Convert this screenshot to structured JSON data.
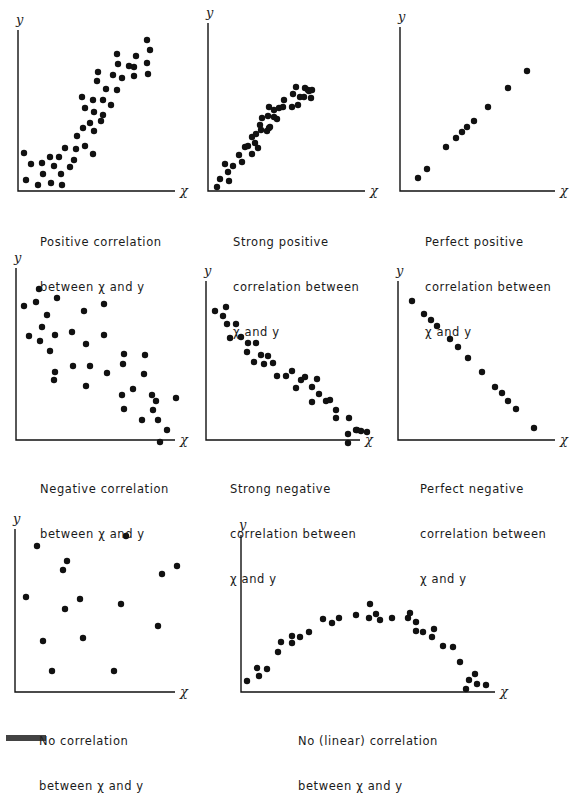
{
  "figure": {
    "title_fragment": "Figure"
  },
  "chart_data": [
    {
      "type": "scatter",
      "title": "Positive correlation between x and y",
      "caption_lines": [
        "Positive correlation",
        "between x and y"
      ],
      "xlabel": "x",
      "ylabel": "y",
      "grid": false,
      "points": [
        [
          24,
          153
        ],
        [
          31,
          164
        ],
        [
          42,
          163
        ],
        [
          50,
          157
        ],
        [
          59,
          157
        ],
        [
          54,
          166
        ],
        [
          43,
          174
        ],
        [
          26,
          180
        ],
        [
          38,
          185
        ],
        [
          51,
          183
        ],
        [
          62,
          185
        ],
        [
          61,
          174
        ],
        [
          70,
          167
        ],
        [
          65,
          148
        ],
        [
          74,
          160
        ],
        [
          76,
          149
        ],
        [
          77,
          136
        ],
        [
          85,
          146
        ],
        [
          83,
          128
        ],
        [
          93,
          154
        ],
        [
          94,
          131
        ],
        [
          90,
          123
        ],
        [
          101,
          121
        ],
        [
          94,
          112
        ],
        [
          85,
          108
        ],
        [
          82,
          97
        ],
        [
          93,
          100
        ],
        [
          103,
          115
        ],
        [
          103,
          100
        ],
        [
          111,
          105
        ],
        [
          106,
          89
        ],
        [
          97,
          81
        ],
        [
          98,
          72
        ],
        [
          113,
          75
        ],
        [
          117,
          90
        ],
        [
          122,
          78
        ],
        [
          118,
          64
        ],
        [
          117,
          54
        ],
        [
          129,
          66
        ],
        [
          134,
          76
        ],
        [
          136,
          56
        ],
        [
          134,
          67
        ],
        [
          147,
          63
        ],
        [
          148,
          74
        ],
        [
          150,
          50
        ],
        [
          147,
          40
        ]
      ]
    },
    {
      "type": "scatter",
      "title": "Strong positive correlation between x and y",
      "caption_lines": [
        "Strong positive",
        "correlation between",
        "x and y"
      ],
      "xlabel": "x",
      "ylabel": "y",
      "grid": false,
      "points": [
        [
          217,
          187
        ],
        [
          220,
          179
        ],
        [
          225,
          164
        ],
        [
          228,
          172
        ],
        [
          229,
          181
        ],
        [
          233,
          166
        ],
        [
          239,
          155
        ],
        [
          242,
          162
        ],
        [
          245,
          147
        ],
        [
          248,
          146
        ],
        [
          252,
          154
        ],
        [
          252,
          137
        ],
        [
          255,
          143
        ],
        [
          256,
          134
        ],
        [
          258,
          148
        ],
        [
          260,
          125
        ],
        [
          261,
          130
        ],
        [
          262,
          118
        ],
        [
          267,
          131
        ],
        [
          268,
          116
        ],
        [
          269,
          128
        ],
        [
          269,
          107
        ],
        [
          270,
          127
        ],
        [
          274,
          117
        ],
        [
          274,
          110
        ],
        [
          277,
          119
        ],
        [
          279,
          108
        ],
        [
          283,
          107
        ],
        [
          284,
          100
        ],
        [
          292,
          107
        ],
        [
          293,
          94
        ],
        [
          298,
          105
        ],
        [
          296,
          87
        ],
        [
          300,
          97
        ],
        [
          304,
          97
        ],
        [
          305,
          88
        ],
        [
          308,
          90
        ],
        [
          309,
          91
        ],
        [
          312,
          90
        ],
        [
          311,
          98
        ]
      ]
    },
    {
      "type": "scatter",
      "title": "Perfect positive correlation between x and y",
      "caption_lines": [
        "Perfect positive",
        "correlation between",
        "x and y"
      ],
      "xlabel": "x",
      "ylabel": "y",
      "grid": false,
      "points": [
        [
          418,
          178
        ],
        [
          427,
          169
        ],
        [
          446,
          147
        ],
        [
          456,
          138
        ],
        [
          462,
          132
        ],
        [
          467,
          127
        ],
        [
          474,
          121
        ],
        [
          488,
          107
        ],
        [
          508,
          88
        ],
        [
          527,
          71
        ]
      ]
    },
    {
      "type": "scatter",
      "title": "Negative correlation between x and y",
      "caption_lines": [
        "Negative correlation",
        "between x and y"
      ],
      "xlabel": "x",
      "ylabel": "y",
      "grid": false,
      "points": [
        [
          24,
          306
        ],
        [
          36,
          302
        ],
        [
          39,
          289
        ],
        [
          57,
          298
        ],
        [
          29,
          336
        ],
        [
          40,
          341
        ],
        [
          47,
          315
        ],
        [
          42,
          327
        ],
        [
          55,
          335
        ],
        [
          50,
          351
        ],
        [
          54,
          380
        ],
        [
          55,
          372
        ],
        [
          72,
          332
        ],
        [
          73,
          366
        ],
        [
          84,
          311
        ],
        [
          86,
          344
        ],
        [
          86,
          386
        ],
        [
          90,
          366
        ],
        [
          104,
          304
        ],
        [
          104,
          335
        ],
        [
          107,
          373
        ],
        [
          124,
          354
        ],
        [
          123,
          364
        ],
        [
          122,
          395
        ],
        [
          124,
          409
        ],
        [
          133,
          389
        ],
        [
          145,
          355
        ],
        [
          144,
          374
        ],
        [
          152,
          395
        ],
        [
          142,
          420
        ],
        [
          153,
          410
        ],
        [
          158,
          420
        ],
        [
          160,
          442
        ],
        [
          167,
          430
        ],
        [
          176,
          398
        ],
        [
          156,
          401
        ]
      ]
    },
    {
      "type": "scatter",
      "title": "Strong negative correlation between x and y",
      "caption_lines": [
        "Strong negative",
        "correlation between",
        "x and y"
      ],
      "xlabel": "x",
      "ylabel": "y",
      "grid": false,
      "points": [
        [
          215,
          311
        ],
        [
          223,
          316
        ],
        [
          226,
          307
        ],
        [
          227,
          324
        ],
        [
          230,
          338
        ],
        [
          236,
          324
        ],
        [
          241,
          337
        ],
        [
          248,
          343
        ],
        [
          247,
          352
        ],
        [
          256,
          343
        ],
        [
          254,
          362
        ],
        [
          261,
          355
        ],
        [
          264,
          364
        ],
        [
          268,
          356
        ],
        [
          273,
          363
        ],
        [
          277,
          376
        ],
        [
          286,
          376
        ],
        [
          292,
          371
        ],
        [
          296,
          388
        ],
        [
          301,
          380
        ],
        [
          305,
          377
        ],
        [
          312,
          387
        ],
        [
          312,
          402
        ],
        [
          319,
          394
        ],
        [
          317,
          379
        ],
        [
          326,
          401
        ],
        [
          330,
          400
        ],
        [
          336,
          418
        ],
        [
          336,
          410
        ],
        [
          349,
          418
        ],
        [
          348,
          434
        ],
        [
          348,
          443
        ],
        [
          356,
          430
        ],
        [
          357,
          430
        ],
        [
          361,
          431
        ],
        [
          367,
          432
        ]
      ]
    },
    {
      "type": "scatter",
      "title": "Perfect negative correlation between x and y",
      "caption_lines": [
        "Perfect negative",
        "correlation between",
        "x and y"
      ],
      "xlabel": "x",
      "ylabel": "y",
      "grid": false,
      "points": [
        [
          412,
          301
        ],
        [
          424,
          314
        ],
        [
          431,
          320
        ],
        [
          437,
          326
        ],
        [
          450,
          339
        ],
        [
          458,
          347
        ],
        [
          468,
          358
        ],
        [
          482,
          372
        ],
        [
          495,
          387
        ],
        [
          502,
          393
        ],
        [
          508,
          401
        ],
        [
          516,
          409
        ],
        [
          534,
          428
        ]
      ]
    },
    {
      "type": "scatter",
      "title": "No correlation between x and y",
      "caption_lines": [
        "No correlation",
        "between x and y"
      ],
      "xlabel": "x",
      "ylabel": "y",
      "grid": false,
      "points": [
        [
          37,
          546
        ],
        [
          26,
          597
        ],
        [
          63,
          570
        ],
        [
          67,
          561
        ],
        [
          65,
          609
        ],
        [
          80,
          599
        ],
        [
          43,
          641
        ],
        [
          52,
          671
        ],
        [
          83,
          638
        ],
        [
          114,
          671
        ],
        [
          121,
          604
        ],
        [
          126,
          536
        ],
        [
          158,
          626
        ],
        [
          162,
          574
        ],
        [
          177,
          566
        ]
      ]
    },
    {
      "type": "scatter",
      "title": "No (linear) correlation between x and y",
      "caption_lines": [
        "No (linear)",
        "correlation between x and y"
      ],
      "xlabel": "x",
      "ylabel": "y",
      "grid": false,
      "points": [
        [
          247,
          681
        ],
        [
          257,
          668
        ],
        [
          259,
          676
        ],
        [
          267,
          669
        ],
        [
          278,
          652
        ],
        [
          281,
          642
        ],
        [
          292,
          636
        ],
        [
          292,
          643
        ],
        [
          300,
          637
        ],
        [
          309,
          632
        ],
        [
          323,
          619
        ],
        [
          332,
          623
        ],
        [
          339,
          618
        ],
        [
          356,
          615
        ],
        [
          369,
          618
        ],
        [
          370,
          604
        ],
        [
          376,
          614
        ],
        [
          380,
          620
        ],
        [
          392,
          618
        ],
        [
          408,
          618
        ],
        [
          410,
          613
        ],
        [
          416,
          631
        ],
        [
          416,
          622
        ],
        [
          423,
          632
        ],
        [
          432,
          637
        ],
        [
          434,
          629
        ],
        [
          443,
          646
        ],
        [
          453,
          647
        ],
        [
          460,
          662
        ],
        [
          466,
          689
        ],
        [
          469,
          680
        ],
        [
          475,
          674
        ],
        [
          477,
          684
        ],
        [
          486,
          685
        ]
      ]
    }
  ],
  "panels": [
    {
      "caption": [
        "Positive correlation",
        "between χ and y"
      ]
    },
    {
      "caption": [
        "Strong positive",
        "correlation between",
        "χ and y"
      ]
    },
    {
      "caption": [
        "Perfect positive",
        "correlation between",
        "χ and y"
      ]
    },
    {
      "caption": [
        "Negative correlation",
        "between χ and y"
      ]
    },
    {
      "caption": [
        "Strong negative",
        "correlation between",
        "χ and y"
      ]
    },
    {
      "caption": [
        "Perfect negative",
        "correlation between",
        "χ and y"
      ]
    },
    {
      "caption": [
        "No correlation",
        "between χ and y"
      ]
    },
    {
      "caption": [
        "No (linear) correlation",
        "between χ and y"
      ]
    }
  ],
  "axes": {
    "x_label": "χ",
    "y_label": "y"
  }
}
